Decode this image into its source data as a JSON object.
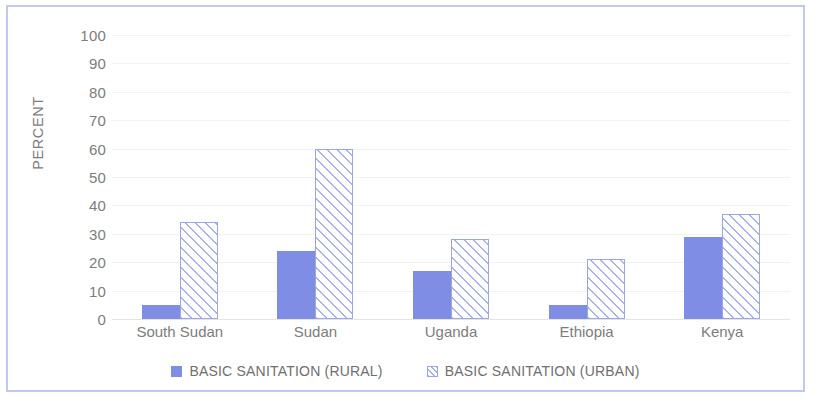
{
  "chart_data": {
    "type": "bar",
    "title": "",
    "subtitle": "",
    "xlabel": "",
    "ylabel": "PERCENT",
    "ylim": [
      0,
      100
    ],
    "ytick_step": 10,
    "yticks": [
      100,
      90,
      80,
      70,
      60,
      50,
      40,
      30,
      20,
      10,
      0
    ],
    "grid": true,
    "grid_axis": "y",
    "legend_position": "bottom-center",
    "categories": [
      "South Sudan",
      "Sudan",
      "Uganda",
      "Ethiopia",
      "Kenya"
    ],
    "series": [
      {
        "name": "BASIC SANITATION (RURAL)",
        "fill": "solid",
        "color": "#7f8de4",
        "values": [
          5,
          24,
          17,
          5,
          29
        ]
      },
      {
        "name": "BASIC SANITATION (URBAN)",
        "fill": "diagonal-hatch",
        "color": "#a9b3e8",
        "values": [
          34,
          60,
          28,
          21,
          37
        ]
      }
    ]
  },
  "frame": {
    "border_color": "#c3c9ee",
    "background_color": "#ffffff"
  }
}
